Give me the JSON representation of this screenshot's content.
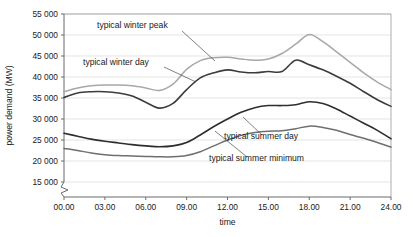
{
  "chart_data": {
    "type": "line",
    "title": "",
    "xlabel": "time",
    "ylabel": "power demand (MW)",
    "xlim": [
      0,
      24
    ],
    "ylim": [
      13500,
      55000
    ],
    "grid": true,
    "legend_position": "inline-annotations",
    "y_axis_break": true,
    "y_break_note": "axis broken between 0 and 15000",
    "xticks": [
      "00.00",
      "03.00",
      "06.00",
      "09.00",
      "12.00",
      "15.00",
      "18.00",
      "21.00",
      "24.00"
    ],
    "xtick_values": [
      0,
      3,
      6,
      9,
      12,
      15,
      18,
      21,
      24
    ],
    "yticks": [
      "15 000",
      "20 000",
      "25 000",
      "30 000",
      "35 000",
      "40 000",
      "45 000",
      "50 000",
      "55 000"
    ],
    "ytick_values": [
      15000,
      20000,
      25000,
      30000,
      35000,
      40000,
      45000,
      50000,
      55000
    ],
    "x": [
      0,
      1,
      2,
      3,
      4,
      5,
      6,
      7,
      8,
      9,
      10,
      11,
      12,
      13,
      14,
      15,
      16,
      17,
      18,
      19,
      20,
      21,
      22,
      23,
      24
    ],
    "series": [
      {
        "name": "typical winter peak",
        "color": "#a8a8a8",
        "width": 1.5,
        "values": [
          36500,
          37400,
          37900,
          38100,
          38100,
          37900,
          37400,
          36800,
          38300,
          41800,
          43900,
          44600,
          44700,
          44300,
          44000,
          44300,
          45600,
          47800,
          50100,
          48400,
          46000,
          43500,
          41000,
          38800,
          37000
        ]
      },
      {
        "name": "typical winter day",
        "color": "#3c3c3c",
        "width": 1.6,
        "values": [
          35100,
          36200,
          36500,
          36500,
          36200,
          35500,
          34000,
          32600,
          33700,
          37000,
          39800,
          41000,
          41700,
          41200,
          41000,
          41300,
          41300,
          44000,
          42900,
          41700,
          40200,
          38500,
          36500,
          34600,
          33000
        ]
      },
      {
        "name": "typical summer day",
        "color": "#2e2e2e",
        "width": 1.6,
        "values": [
          26600,
          25900,
          25200,
          24700,
          24300,
          23900,
          23600,
          23400,
          23600,
          24400,
          26200,
          28200,
          30000,
          31600,
          32700,
          33200,
          33200,
          33400,
          34100,
          33700,
          32400,
          30700,
          29000,
          27300,
          25300
        ]
      },
      {
        "name": "typical summer minimum",
        "color": "#6f6f6f",
        "width": 1.5,
        "values": [
          23000,
          22500,
          21900,
          21500,
          21300,
          21200,
          21100,
          21000,
          21000,
          21300,
          22200,
          23600,
          25000,
          26100,
          26800,
          27100,
          27200,
          27700,
          28300,
          28000,
          27300,
          26300,
          25400,
          24400,
          23300
        ]
      }
    ],
    "annotations": [
      {
        "text": "typical winter peak",
        "label_x": 97,
        "label_y": 28,
        "leader_from": [
          182,
          31
        ],
        "leader_to": [
          215,
          61
        ]
      },
      {
        "text": "typical winter day",
        "label_x": 83,
        "label_y": 65,
        "leader_from": [
          164,
          67
        ],
        "leader_to": [
          196,
          82
        ]
      },
      {
        "text": "typical summer day",
        "label_x": 224,
        "label_y": 139,
        "leader_from": [
          262,
          135
        ],
        "leader_to": [
          243,
          117
        ]
      },
      {
        "text": "typical summer minimum",
        "label_x": 209,
        "label_y": 161,
        "leader_from": [
          247,
          157
        ],
        "leader_to": [
          215,
          131
        ]
      }
    ]
  }
}
